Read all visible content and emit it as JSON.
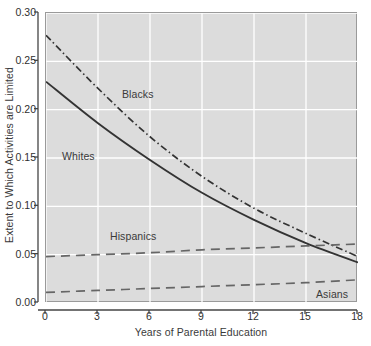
{
  "chart_data": {
    "type": "line",
    "title": "",
    "xlabel": "Years of Parental Education",
    "ylabel": "Extent to Which Activities are Limited",
    "xlim": [
      0,
      18
    ],
    "ylim": [
      0.0,
      0.3
    ],
    "xticks": [
      "0",
      "3",
      "6",
      "9",
      "12",
      "15",
      "18"
    ],
    "xtick_values": [
      0,
      3,
      6,
      9,
      12,
      15,
      18
    ],
    "yticks": [
      "0.00",
      "0.05",
      "0.10",
      "0.15",
      "0.20",
      "0.25",
      "0.30"
    ],
    "ytick_values": [
      0.0,
      0.05,
      0.1,
      0.15,
      0.2,
      0.25,
      0.3
    ],
    "grid": true,
    "grid_color": "#ffffff",
    "plot_background": "#dcdcdc",
    "legend_position": "inline-annotations",
    "x": [
      0,
      3,
      6,
      9,
      12,
      15,
      18
    ],
    "series": [
      {
        "name": "Blacks",
        "style": "dashdot",
        "color": "#333333",
        "values": [
          0.277,
          0.222,
          0.172,
          0.131,
          0.098,
          0.072,
          0.048
        ]
      },
      {
        "name": "Whites",
        "style": "solid",
        "color": "#333333",
        "values": [
          0.229,
          0.186,
          0.148,
          0.114,
          0.086,
          0.062,
          0.042
        ]
      },
      {
        "name": "Hispanics",
        "style": "dashed",
        "color": "#666666",
        "values": [
          0.048,
          0.05,
          0.052,
          0.055,
          0.057,
          0.059,
          0.061
        ]
      },
      {
        "name": "Asians",
        "style": "dashed",
        "color": "#666666",
        "values": [
          0.011,
          0.013,
          0.015,
          0.017,
          0.019,
          0.021,
          0.024
        ]
      }
    ],
    "annotations": [
      {
        "text": "Blacks",
        "x_px": 122,
        "y_px": 88
      },
      {
        "text": "Whites",
        "x_px": 62,
        "y_px": 150
      },
      {
        "text": "Hispanics",
        "x_px": 110,
        "y_px": 230
      },
      {
        "text": "Asians",
        "x_px": 316,
        "y_px": 288
      }
    ]
  }
}
